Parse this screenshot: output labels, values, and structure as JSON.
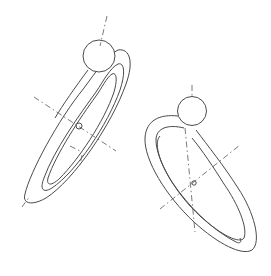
{
  "figure": {
    "background_color": "#ffffff",
    "line_color": "#4a4a4a",
    "dash_color": "#6a6a6a",
    "rings": [
      {
        "name": "left-ring",
        "center": [
          79,
          126
        ],
        "rotation_deg": -57,
        "outer": {
          "rx": 90,
          "ry": 21
        },
        "inner_outer_edge": {
          "rx": 80,
          "ry": 13
        },
        "inner_edge": {
          "rx": 74,
          "ry": 9
        },
        "sphere": {
          "cx": 99,
          "cy": 56,
          "r": 16
        },
        "center_mark_r": 3
      },
      {
        "name": "right-ring",
        "center": [
          197,
          186
        ],
        "rotation_deg": 52,
        "outer": {
          "rx": 82,
          "ry": 42
        },
        "inner_outer_edge": {
          "rx": 74,
          "ry": 33
        },
        "inner_edge": {
          "rx": 68,
          "ry": 28
        },
        "sphere": {
          "cx": 192,
          "cy": 111,
          "r": 14.5
        },
        "center_mark_r": 2
      }
    ]
  }
}
